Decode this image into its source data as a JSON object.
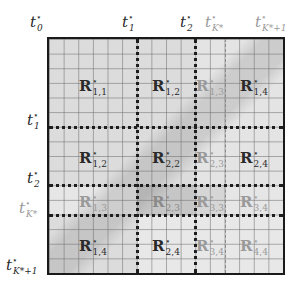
{
  "diagram": {
    "grid": {
      "cells": 16,
      "line_color": "#6e6e6e"
    },
    "colors": {
      "background": "#ffffff",
      "box_fill": "#dcdcdc",
      "border": "#1a1a1a",
      "dark_label": "#2a2a2a",
      "light_label": "#9a9a9a",
      "dark_divider": "#1e1e1e",
      "light_divider": "#8a8a8a",
      "shaded_block": "#c4c4c4",
      "light_block": "#e6e6e6"
    },
    "top_labels": [
      {
        "base": "t",
        "sup": "⋆",
        "sub": "0",
        "tone": "dark"
      },
      {
        "base": "t",
        "sup": "⋆",
        "sub": "1",
        "tone": "dark"
      },
      {
        "base": "t",
        "sup": "⋆",
        "sub": "2",
        "tone": "dark"
      },
      {
        "base": "t",
        "sup": "⋆",
        "sub": "K*",
        "tone": "light"
      },
      {
        "base": "t",
        "sup": "⋆",
        "sub": "K*+1",
        "tone": "light"
      }
    ],
    "left_labels": [
      {
        "base": "t",
        "sup": "⋆",
        "sub": "1",
        "tone": "dark"
      },
      {
        "base": "t",
        "sup": "⋆",
        "sub": "2",
        "tone": "dark"
      },
      {
        "base": "t",
        "sup": "⋆",
        "sub": "K*",
        "tone": "light"
      },
      {
        "base": "t",
        "sup": "⋆",
        "sub": "K*+1",
        "tone": "dark"
      }
    ],
    "regions": [
      {
        "base": "R",
        "sup": "⋆",
        "sub": "1,1",
        "row": 1,
        "col": 1,
        "tone": "dark"
      },
      {
        "base": "R",
        "sup": "⋆",
        "sub": "1,2",
        "row": 1,
        "col": 2,
        "tone": "dark"
      },
      {
        "base": "R",
        "sup": "⋆",
        "sub": "1,3",
        "row": 1,
        "col": 3,
        "tone": "light"
      },
      {
        "base": "R",
        "sup": "⋆",
        "sub": "1,4",
        "row": 1,
        "col": 4,
        "tone": "dark"
      },
      {
        "base": "R",
        "sup": "⋆",
        "sub": "1,2",
        "row": 2,
        "col": 1,
        "tone": "dark"
      },
      {
        "base": "R",
        "sup": "⋆",
        "sub": "2,2",
        "row": 2,
        "col": 2,
        "tone": "dark"
      },
      {
        "base": "R",
        "sup": "⋆",
        "sub": "2,3",
        "row": 2,
        "col": 3,
        "tone": "light"
      },
      {
        "base": "R",
        "sup": "⋆",
        "sub": "2,4",
        "row": 2,
        "col": 4,
        "tone": "dark"
      },
      {
        "base": "R",
        "sup": "⋆",
        "sub": "1,3",
        "row": 3,
        "col": 1,
        "tone": "light"
      },
      {
        "base": "R",
        "sup": "⋆",
        "sub": "2,3",
        "row": 3,
        "col": 2,
        "tone": "light"
      },
      {
        "base": "R",
        "sup": "⋆",
        "sub": "3,3",
        "row": 3,
        "col": 3,
        "tone": "light"
      },
      {
        "base": "R",
        "sup": "⋆",
        "sub": "3,4",
        "row": 3,
        "col": 4,
        "tone": "light"
      },
      {
        "base": "R",
        "sup": "⋆",
        "sub": "1,4",
        "row": 4,
        "col": 1,
        "tone": "dark"
      },
      {
        "base": "R",
        "sup": "⋆",
        "sub": "2,4",
        "row": 4,
        "col": 2,
        "tone": "dark"
      },
      {
        "base": "R",
        "sup": "⋆",
        "sub": "3,4",
        "row": 4,
        "col": 3,
        "tone": "light"
      },
      {
        "base": "R",
        "sup": "⋆",
        "sub": "4,4",
        "row": 4,
        "col": 4,
        "tone": "light"
      }
    ]
  }
}
